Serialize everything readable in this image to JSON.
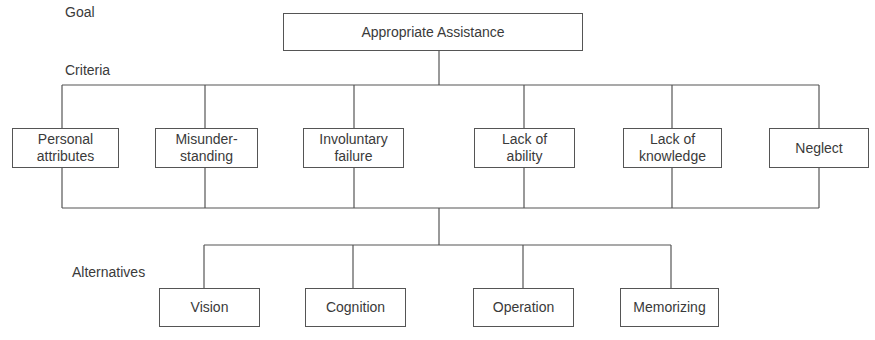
{
  "levels": {
    "goal": "Goal",
    "criteria": "Criteria",
    "alternatives": "Alternatives"
  },
  "goal": {
    "label": "Appropriate Assistance"
  },
  "criteria": [
    {
      "label": "Personal\nattributes"
    },
    {
      "label": "Misunder-\nstanding"
    },
    {
      "label": "Involuntary\nfailure"
    },
    {
      "label": "Lack of\nability"
    },
    {
      "label": "Lack of\nknowledge"
    },
    {
      "label": "Neglect"
    }
  ],
  "alternatives": [
    {
      "label": "Vision"
    },
    {
      "label": "Cognition"
    },
    {
      "label": "Operation"
    },
    {
      "label": "Memorizing"
    }
  ]
}
